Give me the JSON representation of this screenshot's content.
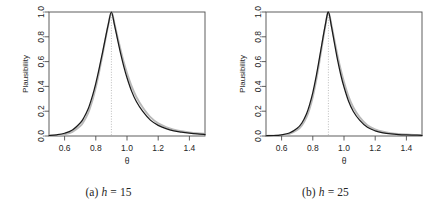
{
  "figure": {
    "panels": [
      {
        "id": "panel-a",
        "caption_label": "(a)",
        "caption_var": "h",
        "caption_eq": "=",
        "caption_value": "15",
        "caption_full": "(a) h = 15"
      },
      {
        "id": "panel-b",
        "caption_label": "(b)",
        "caption_var": "h",
        "caption_eq": "=",
        "caption_value": "25",
        "caption_full": "(b) h = 25"
      }
    ]
  },
  "colors": {
    "curve_black": "#1a1a1a",
    "curve_gray": "#b9b9b9",
    "axis": "#4d4d4d",
    "vline": "#a0a0a0",
    "text": "#262626",
    "background": "#ffffff"
  },
  "chart_data": [
    {
      "type": "line",
      "title": "(a) h = 15",
      "xlabel": "θ",
      "ylabel": "Plausibility",
      "xlim": [
        0.5,
        1.5
      ],
      "ylim": [
        0.0,
        1.0
      ],
      "grid": false,
      "legend": "none",
      "xticks": [
        0.6,
        0.8,
        1.0,
        1.2,
        1.4
      ],
      "xticklabels": [
        "0.6",
        "0.8",
        "1.0",
        "1.2",
        "1.4"
      ],
      "yticks": [
        0.0,
        0.2,
        0.4,
        0.6,
        0.8,
        1.0
      ],
      "yticklabels": [
        "0.0",
        "0.2",
        "0.4",
        "0.6",
        "0.8",
        "1.0"
      ],
      "annotations": [
        {
          "type": "vline",
          "x": 0.9,
          "style": "dotted",
          "label": "peak at 0.9"
        }
      ],
      "series": [
        {
          "name": "black-curve",
          "color": "#1a1a1a",
          "x": [
            0.5,
            0.55,
            0.6,
            0.65,
            0.7,
            0.72,
            0.75,
            0.78,
            0.8,
            0.82,
            0.84,
            0.86,
            0.88,
            0.9,
            0.92,
            0.94,
            0.96,
            0.98,
            1.0,
            1.03,
            1.06,
            1.1,
            1.15,
            1.2,
            1.25,
            1.3,
            1.35,
            1.4,
            1.45,
            1.5
          ],
          "y": [
            0.004,
            0.01,
            0.022,
            0.048,
            0.105,
            0.14,
            0.215,
            0.33,
            0.425,
            0.535,
            0.655,
            0.78,
            0.9,
            1.0,
            0.895,
            0.775,
            0.66,
            0.558,
            0.47,
            0.36,
            0.278,
            0.2,
            0.128,
            0.086,
            0.06,
            0.042,
            0.031,
            0.023,
            0.017,
            0.013
          ]
        },
        {
          "name": "gray-curve",
          "color": "#b9b9b9",
          "x": [
            0.5,
            0.55,
            0.6,
            0.65,
            0.7,
            0.72,
            0.75,
            0.78,
            0.8,
            0.82,
            0.84,
            0.86,
            0.88,
            0.9,
            0.92,
            0.94,
            0.96,
            0.98,
            1.0,
            1.03,
            1.06,
            1.1,
            1.15,
            1.2,
            1.25,
            1.3,
            1.35,
            1.4,
            1.45,
            1.5
          ],
          "y": [
            0.002,
            0.006,
            0.014,
            0.033,
            0.08,
            0.112,
            0.182,
            0.295,
            0.392,
            0.508,
            0.635,
            0.768,
            0.895,
            1.0,
            0.905,
            0.795,
            0.69,
            0.592,
            0.508,
            0.4,
            0.315,
            0.232,
            0.152,
            0.102,
            0.072,
            0.051,
            0.038,
            0.029,
            0.022,
            0.017
          ]
        }
      ]
    },
    {
      "type": "line",
      "title": "(b) h = 25",
      "xlabel": "θ",
      "ylabel": "Plausibility",
      "xlim": [
        0.5,
        1.5
      ],
      "ylim": [
        0.0,
        1.0
      ],
      "grid": false,
      "legend": "none",
      "xticks": [
        0.6,
        0.8,
        1.0,
        1.2,
        1.4
      ],
      "xticklabels": [
        "0.6",
        "0.8",
        "1.0",
        "1.2",
        "1.4"
      ],
      "yticks": [
        0.0,
        0.2,
        0.4,
        0.6,
        0.8,
        1.0
      ],
      "yticklabels": [
        "0.0",
        "0.2",
        "0.4",
        "0.6",
        "0.8",
        "1.0"
      ],
      "annotations": [
        {
          "type": "vline",
          "x": 0.9,
          "style": "dotted",
          "label": "peak at 0.9"
        }
      ],
      "series": [
        {
          "name": "black-curve",
          "color": "#1a1a1a",
          "x": [
            0.5,
            0.55,
            0.6,
            0.65,
            0.7,
            0.73,
            0.76,
            0.78,
            0.8,
            0.82,
            0.84,
            0.86,
            0.88,
            0.9,
            0.92,
            0.94,
            0.96,
            0.98,
            1.0,
            1.03,
            1.06,
            1.1,
            1.15,
            1.2,
            1.25,
            1.3,
            1.35,
            1.4,
            1.45,
            1.5
          ],
          "y": [
            0.002,
            0.004,
            0.01,
            0.024,
            0.062,
            0.105,
            0.18,
            0.255,
            0.35,
            0.47,
            0.61,
            0.755,
            0.895,
            1.0,
            0.88,
            0.74,
            0.605,
            0.49,
            0.395,
            0.278,
            0.198,
            0.128,
            0.07,
            0.042,
            0.026,
            0.017,
            0.012,
            0.009,
            0.007,
            0.005
          ]
        },
        {
          "name": "gray-curve",
          "color": "#b9b9b9",
          "x": [
            0.5,
            0.55,
            0.6,
            0.65,
            0.7,
            0.73,
            0.76,
            0.78,
            0.8,
            0.82,
            0.84,
            0.86,
            0.88,
            0.9,
            0.92,
            0.94,
            0.96,
            0.98,
            1.0,
            1.03,
            1.06,
            1.1,
            1.15,
            1.2,
            1.25,
            1.3,
            1.35,
            1.4,
            1.45,
            1.5
          ],
          "y": [
            0.001,
            0.003,
            0.007,
            0.018,
            0.048,
            0.085,
            0.152,
            0.222,
            0.315,
            0.436,
            0.58,
            0.735,
            0.885,
            1.0,
            0.893,
            0.765,
            0.64,
            0.53,
            0.435,
            0.315,
            0.23,
            0.152,
            0.086,
            0.053,
            0.034,
            0.023,
            0.016,
            0.012,
            0.009,
            0.007
          ]
        }
      ]
    }
  ]
}
